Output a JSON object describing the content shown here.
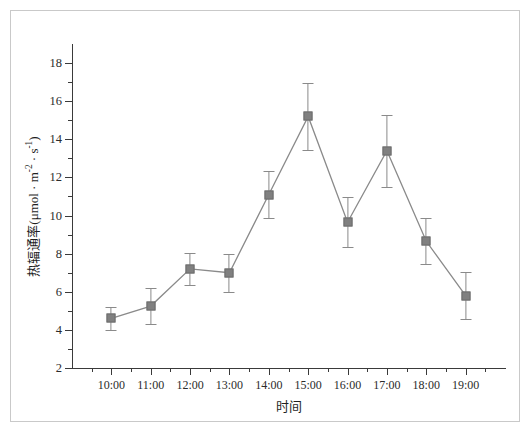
{
  "chart_data": {
    "type": "line",
    "title": "",
    "xlabel": "时间",
    "ylabel": "热辐通率(μmol · m-2 · s-1)",
    "ylabel_base": "热辐通率(μmol · m",
    "ylabel_sup1": "-2",
    "ylabel_mid": " · s",
    "ylabel_sup2": "-1",
    "ylabel_tail": ")",
    "categories": [
      "10:00",
      "11:00",
      "12:00",
      "13:00",
      "14:00",
      "15:00",
      "16:00",
      "17:00",
      "18:00",
      "19:00"
    ],
    "values": [
      4.6,
      5.25,
      7.2,
      7.0,
      11.1,
      15.2,
      9.65,
      13.4,
      8.65,
      5.8
    ],
    "errors": [
      0.62,
      0.95,
      0.85,
      1.0,
      1.25,
      1.75,
      1.3,
      1.9,
      1.2,
      1.25
    ],
    "ylim": [
      2,
      19
    ],
    "yticks_major": [
      2,
      4,
      6,
      8,
      10,
      12,
      14,
      16,
      18
    ],
    "yticks_minor": [
      3,
      5,
      7,
      9,
      11,
      13,
      15,
      17
    ],
    "grid": false,
    "legend": "none",
    "marker": "square",
    "marker_color": "#808080",
    "line_color": "#8a8a8a",
    "axis_color": "#3a3a3a",
    "background": "#ffffff"
  }
}
